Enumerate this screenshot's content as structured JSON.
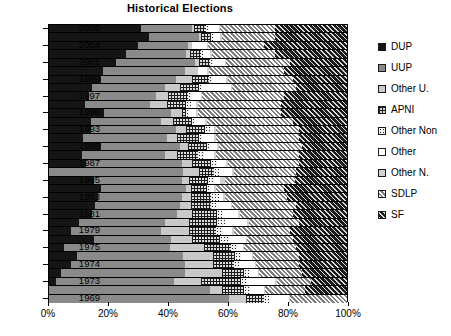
{
  "chart_data": {
    "type": "bar",
    "subtype": "stacked-horizontal-100percent",
    "title": "Historical Elections",
    "xlabel": "",
    "ylabel": "",
    "xlim": [
      0,
      100
    ],
    "xticks": [
      "0%",
      "20%",
      "40%",
      "60%",
      "80%",
      "100%"
    ],
    "xtick_values": [
      0,
      20,
      40,
      60,
      80,
      100
    ],
    "grid": false,
    "legend_position": "right",
    "orientation": "horizontal",
    "categories": [
      "2005",
      "2005b",
      "2004",
      "2004b",
      "2001",
      "2001b",
      "1999",
      "1999b",
      "1997",
      "1997b",
      "1996",
      "1996b",
      "1993",
      "1993b",
      "1989",
      "1989b",
      "1987",
      "1987b",
      "1985",
      "1985b",
      "1983",
      "1983b",
      "1981",
      "1981b",
      "1979",
      "1979b",
      "1975",
      "1975b",
      "1974",
      "1974b",
      "1973",
      "1973b",
      "1969"
    ],
    "year_labels": [
      "2005",
      "2004",
      "2001",
      "1999",
      "1997",
      "1996",
      "1993",
      "1989",
      "1987",
      "1985",
      "1983",
      "1981",
      "1979",
      "1975",
      "1974",
      "1973",
      "1969"
    ],
    "series": [
      {
        "name": "DUP",
        "key": "dup",
        "color": "#151515",
        "pattern": "solid"
      },
      {
        "name": "UUP",
        "key": "uup",
        "color": "#8a8a8a",
        "pattern": "solid"
      },
      {
        "name": "Other U.",
        "key": "otheru",
        "color": "#c9c9c9",
        "pattern": "solid"
      },
      {
        "name": "APNI",
        "key": "apni",
        "color": "#dcdcdc",
        "pattern": "grid"
      },
      {
        "name": "Other Non",
        "key": "othernon",
        "color": "#f2f2f2",
        "pattern": "dots"
      },
      {
        "name": "Other",
        "key": "other",
        "color": "#ffffff",
        "pattern": "solid"
      },
      {
        "name": "Other N.",
        "key": "othern",
        "color": "#d2d2d2",
        "pattern": "solid"
      },
      {
        "name": "SDLP",
        "key": "sdlp",
        "color": "#b9b9b9",
        "pattern": "hatch-light"
      },
      {
        "name": "SF",
        "key": "sf",
        "color": "#3a3a3a",
        "pattern": "hatch-dark"
      }
    ],
    "rows": [
      {
        "label": "2005",
        "values": {
          "dup": 31.0,
          "uup": 17.0,
          "otheru": 0.6,
          "apni": 4.0,
          "othernon": 1.0,
          "other": 3.4,
          "othern": 0.4,
          "sdlp": 18.6,
          "sf": 24.0
        }
      },
      {
        "label": "",
        "values": {
          "dup": 33.5,
          "uup": 17.0,
          "otheru": 0.6,
          "apni": 3.4,
          "othernon": 0.8,
          "other": 2.2,
          "othern": 0.5,
          "sdlp": 18.0,
          "sf": 24.0
        }
      },
      {
        "label": "2004",
        "values": {
          "dup": 30.0,
          "uup": 16.8,
          "otheru": 1.2,
          "apni": 0.0,
          "othernon": 0.0,
          "other": 5.0,
          "othern": 0.5,
          "sdlp": 18.5,
          "sf": 28.0
        }
      },
      {
        "label": "",
        "values": {
          "dup": 26.0,
          "uup": 20.0,
          "otheru": 1.4,
          "apni": 3.6,
          "othernon": 0.8,
          "other": 2.2,
          "othern": 0.6,
          "sdlp": 21.4,
          "sf": 24.0
        }
      },
      {
        "label": "2001",
        "values": {
          "dup": 22.5,
          "uup": 26.5,
          "otheru": 1.2,
          "apni": 3.8,
          "othernon": 0.9,
          "other": 4.1,
          "othern": 0.5,
          "sdlp": 21.5,
          "sf": 19.0
        }
      },
      {
        "label": "",
        "values": {
          "dup": 18.0,
          "uup": 27.5,
          "otheru": 4.5,
          "apni": 0.0,
          "othernon": 0.0,
          "other": 3.0,
          "othern": 0.6,
          "sdlp": 25.4,
          "sf": 21.0
        }
      },
      {
        "label": "1999",
        "values": {
          "dup": 17.5,
          "uup": 25.0,
          "otheru": 5.5,
          "apni": 5.8,
          "othernon": 1.4,
          "other": 4.3,
          "othern": 0.5,
          "sdlp": 22.0,
          "sf": 18.0
        }
      },
      {
        "label": "",
        "values": {
          "dup": 14.5,
          "uup": 24.5,
          "otheru": 5.0,
          "apni": 6.5,
          "othernon": 1.0,
          "other": 9.5,
          "othern": 0.5,
          "sdlp": 21.5,
          "sf": 17.0
        }
      },
      {
        "label": "1997",
        "values": {
          "dup": 13.5,
          "uup": 22.5,
          "otheru": 4.0,
          "apni": 6.5,
          "othernon": 1.5,
          "other": 3.0,
          "othern": 0.5,
          "sdlp": 27.5,
          "sf": 21.0
        }
      },
      {
        "label": "",
        "values": {
          "dup": 12.0,
          "uup": 22.0,
          "otheru": 5.5,
          "apni": 6.5,
          "othernon": 1.5,
          "other": 2.0,
          "othern": 0.5,
          "sdlp": 28.0,
          "sf": 22.0
        }
      },
      {
        "label": "1996",
        "values": {
          "dup": 18.5,
          "uup": 22.5,
          "otheru": 3.5,
          "apni": 1.5,
          "othernon": 1.0,
          "other": 2.5,
          "othern": 0.5,
          "sdlp": 28.0,
          "sf": 22.0
        }
      },
      {
        "label": "",
        "values": {
          "dup": 14.0,
          "uup": 23.5,
          "otheru": 4.0,
          "apni": 6.5,
          "othernon": 1.0,
          "other": 3.5,
          "othern": 0.5,
          "sdlp": 29.0,
          "sf": 18.0
        }
      },
      {
        "label": "1993",
        "values": {
          "dup": 14.0,
          "uup": 28.5,
          "otheru": 3.5,
          "apni": 6.5,
          "othernon": 1.5,
          "other": 1.5,
          "othern": 0.5,
          "sdlp": 28.0,
          "sf": 16.0
        }
      },
      {
        "label": "",
        "values": {
          "dup": 11.5,
          "uup": 28.0,
          "otheru": 3.5,
          "apni": 7.5,
          "othernon": 1.0,
          "other": 4.0,
          "othern": 0.5,
          "sdlp": 28.0,
          "sf": 16.0
        }
      },
      {
        "label": "1989",
        "values": {
          "dup": 17.5,
          "uup": 26.5,
          "otheru": 2.5,
          "apni": 6.5,
          "othernon": 1.5,
          "other": 2.0,
          "othern": 0.5,
          "sdlp": 28.0,
          "sf": 15.0
        }
      },
      {
        "label": "",
        "values": {
          "dup": 11.0,
          "uup": 28.0,
          "otheru": 4.0,
          "apni": 7.0,
          "othernon": 2.0,
          "other": 3.5,
          "othern": 0.5,
          "sdlp": 28.0,
          "sf": 16.0
        }
      },
      {
        "label": "1987",
        "values": {
          "dup": 12.5,
          "uup": 32.0,
          "otheru": 3.5,
          "apni": 6.5,
          "othernon": 2.0,
          "other": 3.0,
          "othern": 0.5,
          "sdlp": 24.0,
          "sf": 16.0
        }
      },
      {
        "label": "",
        "values": {
          "dup": 0.0,
          "uup": 45.0,
          "otheru": 5.5,
          "apni": 5.0,
          "othernon": 1.5,
          "other": 4.5,
          "othern": 0.5,
          "sdlp": 21.0,
          "sf": 17.0
        }
      },
      {
        "label": "1985",
        "values": {
          "dup": 15.0,
          "uup": 29.5,
          "otheru": 2.5,
          "apni": 6.5,
          "othernon": 2.0,
          "other": 2.0,
          "othern": 1.5,
          "sdlp": 23.5,
          "sf": 17.5
        }
      },
      {
        "label": "",
        "values": {
          "dup": 17.5,
          "uup": 28.5,
          "otheru": 1.5,
          "apni": 5.5,
          "othernon": 1.5,
          "other": 1.0,
          "othern": 0.5,
          "sdlp": 23.0,
          "sf": 21.0
        }
      },
      {
        "label": "1983",
        "values": {
          "dup": 16.5,
          "uup": 28.0,
          "otheru": 3.0,
          "apni": 7.0,
          "othernon": 2.5,
          "other": 1.5,
          "othern": 0.5,
          "sdlp": 21.0,
          "sf": 20.0
        }
      },
      {
        "label": "",
        "values": {
          "dup": 15.5,
          "uup": 28.5,
          "otheru": 3.5,
          "apni": 7.0,
          "othernon": 2.0,
          "other": 4.5,
          "othern": 0.5,
          "sdlp": 21.5,
          "sf": 17.0
        }
      },
      {
        "label": "1981",
        "values": {
          "dup": 14.5,
          "uup": 28.5,
          "otheru": 5.0,
          "apni": 8.5,
          "othernon": 2.0,
          "other": 5.0,
          "othern": 0.5,
          "sdlp": 18.0,
          "sf": 18.0
        }
      },
      {
        "label": "",
        "values": {
          "dup": 10.0,
          "uup": 29.0,
          "otheru": 8.0,
          "apni": 9.5,
          "othernon": 2.5,
          "other": 7.5,
          "othern": 0.5,
          "sdlp": 17.0,
          "sf": 16.0
        }
      },
      {
        "label": "1979",
        "values": {
          "dup": 7.5,
          "uup": 30.0,
          "otheru": 9.5,
          "apni": 9.0,
          "othernon": 2.5,
          "other": 3.0,
          "othern": 0.5,
          "sdlp": 19.0,
          "sf": 19.0
        }
      },
      {
        "label": "",
        "values": {
          "dup": 15.0,
          "uup": 26.0,
          "otheru": 7.0,
          "apni": 9.5,
          "othernon": 3.0,
          "other": 5.5,
          "othern": 0.5,
          "sdlp": 15.5,
          "sf": 18.0
        }
      },
      {
        "label": "1975",
        "values": {
          "dup": 5.0,
          "uup": 35.5,
          "otheru": 11.5,
          "apni": 9.0,
          "othernon": 2.0,
          "other": 2.0,
          "othern": 0.5,
          "sdlp": 17.5,
          "sf": 17.0
        }
      },
      {
        "label": "",
        "values": {
          "dup": 9.5,
          "uup": 35.5,
          "otheru": 10.0,
          "apni": 7.5,
          "othernon": 2.0,
          "other": 3.5,
          "othern": 0.5,
          "sdlp": 15.5,
          "sf": 16.0
        }
      },
      {
        "label": "1974",
        "values": {
          "dup": 7.5,
          "uup": 38.0,
          "otheru": 9.5,
          "apni": 7.0,
          "othernon": 2.0,
          "other": 5.0,
          "othern": 0.5,
          "sdlp": 14.5,
          "sf": 16.0
        }
      },
      {
        "label": "",
        "values": {
          "dup": 4.0,
          "uup": 41.5,
          "otheru": 12.5,
          "apni": 7.5,
          "othernon": 1.5,
          "other": 3.0,
          "othern": 0.5,
          "sdlp": 14.5,
          "sf": 15.0
        }
      },
      {
        "label": "1973",
        "values": {
          "dup": 2.5,
          "uup": 39.5,
          "otheru": 9.0,
          "apni": 13.5,
          "othernon": 2.0,
          "other": 9.5,
          "othern": 0.5,
          "sdlp": 11.5,
          "sf": 12.0
        }
      },
      {
        "label": "",
        "values": {
          "dup": 0.0,
          "uup": 54.0,
          "otheru": 4.0,
          "apni": 7.5,
          "othernon": 2.0,
          "other": 4.5,
          "othern": 0.5,
          "sdlp": 13.5,
          "sf": 14.0
        }
      },
      {
        "label": "1969",
        "values": {
          "dup": 0.0,
          "uup": 60.5,
          "otheru": 5.5,
          "apni": 6.0,
          "othernon": 2.0,
          "other": 6.5,
          "othern": 0.5,
          "sdlp": 19.0,
          "sf": 0.0
        }
      }
    ]
  },
  "legend": {
    "items": [
      {
        "label": "DUP"
      },
      {
        "label": "UUP"
      },
      {
        "label": "Other U."
      },
      {
        "label": "APNI"
      },
      {
        "label": "Other Non"
      },
      {
        "label": "Other"
      },
      {
        "label": "Other N."
      },
      {
        "label": "SDLP"
      },
      {
        "label": "SF"
      }
    ]
  }
}
